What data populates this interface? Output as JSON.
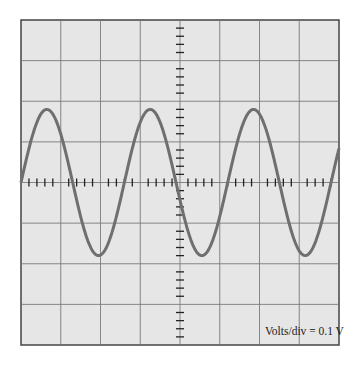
{
  "figure": {
    "type": "oscilloscope-display",
    "volts_per_div_label": "Volts/div = 0.1  V",
    "colors": {
      "screen": "#e6e6e6",
      "grid": "#7a7a7a",
      "border": "#444444",
      "trace": "#6f6f6f",
      "ticks": "#222222"
    },
    "grid": {
      "columns": 8,
      "rows": 8,
      "minor_ticks_per_div": 5
    }
  },
  "chart_data": {
    "type": "line",
    "title": "",
    "xlabel": "",
    "ylabel": "",
    "annotation": "Volts/div = 0.1  V",
    "x_divisions": 8,
    "y_divisions": 8,
    "ylim_div": [
      -4,
      4
    ],
    "series": [
      {
        "name": "sine wave",
        "shape": "sine",
        "amplitude_div": 1.8,
        "amplitude_volts": 0.18,
        "period_div": 2.6,
        "phase": "starts at 0 rising at left edge",
        "cycles_visible": 3.1
      }
    ]
  }
}
